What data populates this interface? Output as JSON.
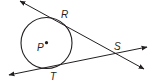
{
  "diagram": {
    "type": "geometry-tangent-lines",
    "circle": {
      "center_label": "P",
      "cx": 46.5,
      "cy": 43,
      "r": 25.5
    },
    "points": [
      {
        "label": "P",
        "x": 46.5,
        "y": 42.7,
        "label_x": 37,
        "label_y": 51
      },
      {
        "label": "R",
        "x": 57,
        "y": 19,
        "label_x": 61,
        "label_y": 18
      },
      {
        "label": "S",
        "x": 112,
        "y": 53,
        "label_x": 114,
        "label_y": 50
      },
      {
        "label": "T",
        "x": 43,
        "y": 68,
        "label_x": 50,
        "label_y": 79
      }
    ],
    "lines": [
      {
        "name": "line-RS",
        "x1": 20,
        "y1": 1,
        "x2": 144,
        "y2": 69,
        "arrows": "both"
      },
      {
        "name": "line-TS",
        "x1": 9,
        "y1": 75,
        "x2": 147,
        "y2": 47,
        "arrows": "both"
      }
    ],
    "stroke_color": "#231f20"
  }
}
